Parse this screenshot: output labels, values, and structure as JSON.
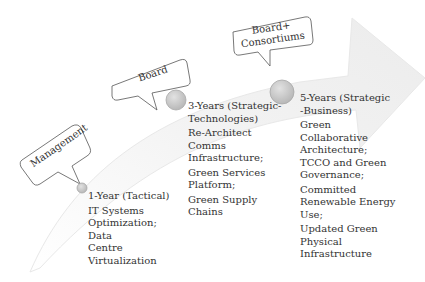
{
  "diagram": {
    "type": "roadmap-arrow",
    "colors": {
      "arrow_fill": "#f4f4f4",
      "arrow_edge": "#e6e6e6",
      "node_fill": "#c9c9c9",
      "node_stroke": "#a8a8a8",
      "callout_stroke": "#555555",
      "text": "#333333"
    },
    "callouts": [
      {
        "label_lines": [
          "Management"
        ]
      },
      {
        "label_lines": [
          "Board"
        ]
      },
      {
        "label_lines": [
          "Board+",
          "Consortiums"
        ]
      }
    ],
    "milestones": [
      {
        "title_lines": [
          "1-Year (Tactical)"
        ],
        "items": [
          "IT Systems",
          "Optimization;",
          "Data",
          "Centre",
          "Virtualization"
        ]
      },
      {
        "title_lines": [
          "3-Years (Strategic-",
          "Technologies)"
        ],
        "items": [
          "Re-Architect",
          "Comms",
          "Infrastructure;",
          "Green Services",
          "Platform;",
          "Green Supply",
          "Chains"
        ]
      },
      {
        "title_lines": [
          "5-Years (Strategic",
          "-Business)"
        ],
        "items": [
          "Green",
          "Collaborative",
          "Architecture;",
          "TCCO and Green",
          "Governance;",
          "Committed",
          "Renewable Energy",
          "Use;",
          "Updated Green",
          "Physical",
          "Infrastructure"
        ]
      }
    ]
  }
}
